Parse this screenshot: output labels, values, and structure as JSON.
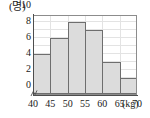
{
  "chart_data": {
    "type": "bar",
    "title": "",
    "subtitle": "",
    "xlabel": "",
    "ylabel": "",
    "x_unit": "(kg)",
    "y_unit": "(명)",
    "categories": [
      "40~45",
      "45~50",
      "50~55",
      "55~60",
      "60~65",
      "65~70"
    ],
    "bin_edges": [
      40,
      45,
      50,
      55,
      60,
      65,
      70
    ],
    "values": [
      5,
      7,
      9,
      8,
      4,
      2
    ],
    "x_tick_labels": [
      "40",
      "45",
      "50",
      "55",
      "60",
      "65",
      "70"
    ],
    "y_tick_labels": [
      "0",
      "2",
      "4",
      "6",
      "8",
      "10"
    ],
    "y_tick_values": [
      0,
      2,
      4,
      6,
      8,
      10
    ],
    "xlim": [
      40,
      70
    ],
    "ylim": [
      0,
      10
    ],
    "grid": true,
    "legend": false,
    "legend_position": "none",
    "axis_break": true,
    "colors": {
      "bar_fill": "#dcdcdc",
      "bar_border": "#6e6e6e",
      "grid": "#e3e3e3",
      "axis": "#4d4d4d",
      "frame": "#8c8c8c",
      "background": "#ffffff",
      "text": "#1a1a1a"
    }
  }
}
